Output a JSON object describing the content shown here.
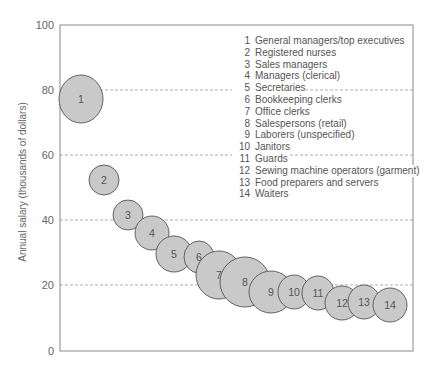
{
  "chart_data": {
    "type": "scatter",
    "subtype": "bubble",
    "title": "",
    "xlabel": "",
    "ylabel": "Annual salary (thousands of dollars)",
    "ylim": [
      0,
      100
    ],
    "yticks": [
      0,
      20,
      40,
      60,
      80,
      100
    ],
    "grid": {
      "y": [
        20,
        40,
        60,
        80
      ],
      "style": "dashed"
    },
    "legend_position": "upper right (inside plot)",
    "points": [
      {
        "id": 1,
        "label": "General managers/top executives",
        "salary": 77,
        "relative_size": 23
      },
      {
        "id": 2,
        "label": "Registered nurses",
        "salary": 52,
        "relative_size": 15
      },
      {
        "id": 3,
        "label": "Sales managers",
        "salary": 42,
        "relative_size": 15
      },
      {
        "id": 4,
        "label": "Managers (clerical)",
        "salary": 36,
        "relative_size": 17
      },
      {
        "id": 5,
        "label": "Secretaries",
        "salary": 30,
        "relative_size": 18
      },
      {
        "id": 6,
        "label": "Bookkeeping clerks",
        "salary": 29,
        "relative_size": 15
      },
      {
        "id": 7,
        "label": "Office clerks",
        "salary": 23,
        "relative_size": 23
      },
      {
        "id": 8,
        "label": "Salespersons (retail)",
        "salary": 21,
        "relative_size": 25
      },
      {
        "id": 9,
        "label": "Laborers (unspecified)",
        "salary": 18,
        "relative_size": 22
      },
      {
        "id": 10,
        "label": "Janitors",
        "salary": 18,
        "relative_size": 17
      },
      {
        "id": 11,
        "label": "Guards",
        "salary": 18,
        "relative_size": 17
      },
      {
        "id": 12,
        "label": "Sewing machine operators (garment)",
        "salary": 15,
        "relative_size": 17
      },
      {
        "id": 13,
        "label": "Food preparers and servers",
        "salary": 15,
        "relative_size": 17
      },
      {
        "id": 14,
        "label": "Waiters",
        "salary": 14,
        "relative_size": 17
      }
    ]
  },
  "axis": {
    "ylabel": "Annual salary (thousands of dollars)",
    "ticks": [
      "0",
      "20",
      "40",
      "60",
      "80",
      "100"
    ]
  },
  "legend": [
    {
      "num": "1",
      "label": "General managers/top executives"
    },
    {
      "num": "2",
      "label": "Registered nurses"
    },
    {
      "num": "3",
      "label": "Sales managers"
    },
    {
      "num": "4",
      "label": "Managers (clerical)"
    },
    {
      "num": "5",
      "label": "Secretaries"
    },
    {
      "num": "6",
      "label": "Bookkeeping clerks"
    },
    {
      "num": "7",
      "label": "Office clerks"
    },
    {
      "num": "8",
      "label": "Salespersons (retail)"
    },
    {
      "num": "9",
      "label": "Laborers (unspecified)"
    },
    {
      "num": "10",
      "label": "Janitors"
    },
    {
      "num": "11",
      "label": "Guards"
    },
    {
      "num": "12",
      "label": "Sewing machine operators (garment)"
    },
    {
      "num": "13",
      "label": "Food preparers and servers"
    },
    {
      "num": "14",
      "label": "Waiters"
    }
  ],
  "bubbles": [
    {
      "num": "1",
      "cx": 81,
      "cy": 99,
      "rx": 22,
      "ry": 24
    },
    {
      "num": "2",
      "cx": 104,
      "cy": 180,
      "rx": 15,
      "ry": 15
    },
    {
      "num": "3",
      "cx": 128,
      "cy": 215,
      "rx": 15,
      "ry": 15
    },
    {
      "num": "4",
      "cx": 152,
      "cy": 233,
      "rx": 17,
      "ry": 17
    },
    {
      "num": "5",
      "cx": 174,
      "cy": 254,
      "rx": 18,
      "ry": 18
    },
    {
      "num": "6",
      "cx": 199,
      "cy": 257,
      "rx": 15,
      "ry": 16
    },
    {
      "num": "7",
      "cx": 219,
      "cy": 275,
      "rx": 23,
      "ry": 24
    },
    {
      "num": "8",
      "cx": 245,
      "cy": 282,
      "rx": 25,
      "ry": 25
    },
    {
      "num": "9",
      "cx": 271,
      "cy": 292,
      "rx": 22,
      "ry": 21
    },
    {
      "num": "10",
      "cx": 294,
      "cy": 292,
      "rx": 16,
      "ry": 17
    },
    {
      "num": "11",
      "cx": 318,
      "cy": 293,
      "rx": 16,
      "ry": 17
    },
    {
      "num": "12",
      "cx": 342,
      "cy": 303,
      "rx": 17,
      "ry": 17
    },
    {
      "num": "13",
      "cx": 364,
      "cy": 302,
      "rx": 16,
      "ry": 17
    },
    {
      "num": "14",
      "cx": 390,
      "cy": 305,
      "rx": 17,
      "ry": 17
    }
  ]
}
